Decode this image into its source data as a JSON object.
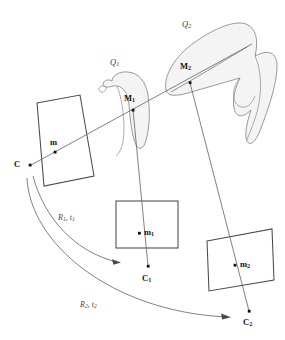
{
  "figure": {
    "background_color": "#ffffff",
    "line_color": "#555555",
    "stroke_color_planes": "#4a4a4a",
    "blob_fill": "#f2f2f2",
    "blob_stroke": "#777777",
    "point_color": "#111111"
  },
  "labels": {
    "camera_center_0": "C",
    "image_point_0": "m",
    "space_curve_1": "Q",
    "space_curve_1_sub": "1",
    "space_point_1": "M",
    "space_point_1_sub": "1",
    "space_curve_2": "Q",
    "space_curve_2_sub": "2",
    "space_point_2": "M",
    "space_point_2_sub": "2",
    "image_point_1": "m",
    "image_point_1_sub": "1",
    "camera_center_1": "C",
    "camera_center_1_sub": "1",
    "image_point_2": "m",
    "image_point_2_sub": "2",
    "camera_center_2": "C",
    "camera_center_2_sub": "2",
    "motion_1_rot": "R",
    "motion_1_rot_sub": "1",
    "motion_1_sep": ", ",
    "motion_1_trans": "t",
    "motion_1_trans_sub": "1",
    "motion_2_rot": "R",
    "motion_2_rot_sub": "2",
    "motion_2_sep": ", ",
    "motion_2_trans": "t",
    "motion_2_trans_sub": "2"
  },
  "points": {
    "C": {
      "x": 30,
      "y": 165
    },
    "m": {
      "x": 55,
      "y": 152
    },
    "M1": {
      "x": 133,
      "y": 110
    },
    "M2": {
      "x": 190,
      "y": 82
    },
    "m1": {
      "x": 139,
      "y": 233
    },
    "C1": {
      "x": 148,
      "y": 266
    },
    "m2": {
      "x": 235,
      "y": 265
    },
    "C2": {
      "x": 249,
      "y": 311
    }
  }
}
